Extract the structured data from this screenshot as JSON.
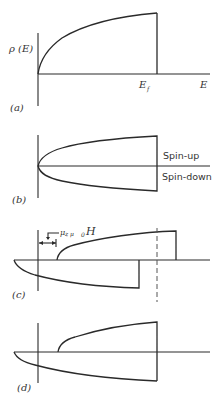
{
  "figure": {
    "panels": [
      {
        "id": "a",
        "label": "(a)",
        "y_axis_label": "ρ (E)",
        "x_tick_label": "E",
        "x_tick_sub": "f",
        "x_axis_label": "E"
      },
      {
        "id": "b",
        "label": "(b)",
        "upper_label": "Spin-up",
        "lower_label": "Spin-down"
      },
      {
        "id": "c",
        "label": "(c)",
        "shift_label": "μ",
        "shift_label_rest": "z μ",
        "shift_label_sub": "0",
        "shift_label_H": "H"
      },
      {
        "id": "d",
        "label": "(d)"
      }
    ]
  }
}
